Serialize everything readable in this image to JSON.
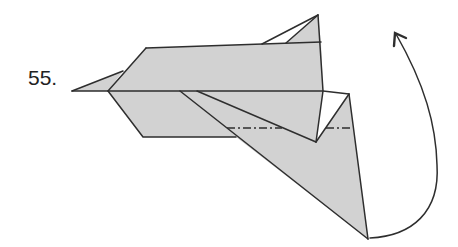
{
  "step": {
    "number": "55."
  },
  "diagram": {
    "colors": {
      "paper_fill": "#d2d2d2",
      "line": "#2e2e2e",
      "background": "#ffffff",
      "text": "#222222"
    },
    "fills": [
      {
        "name": "nose-flap",
        "points": "72,91 123,71 108,91"
      },
      {
        "name": "top-fin-flap",
        "points": "286,43 318,15 321,43"
      },
      {
        "name": "upper-body",
        "points": "108,91 146,48 321,42 323,91"
      },
      {
        "name": "lower-body",
        "points": "108,91 143,137 236,137 368,239 349,94 316,142 323,91"
      }
    ],
    "lines": [
      {
        "name": "nose-upper-edge",
        "points": "72,91 123,71"
      },
      {
        "name": "body-upper-left-edge",
        "points": "108,91 146,48"
      },
      {
        "name": "body-top-edge",
        "points": "146,48 321,42"
      },
      {
        "name": "top-fin-outer-edge",
        "points": "262,44 318,15"
      },
      {
        "name": "top-fin-inner-edge",
        "points": "286,43 318,15"
      },
      {
        "name": "body-right-edge",
        "points": "318,15 323,91 316,142"
      },
      {
        "name": "center-horizontal-edge",
        "points": "72,91 323,91 349,94"
      },
      {
        "name": "lower-body-left-edge",
        "points": "108,91 143,137 236,137"
      },
      {
        "name": "lower-flap-left-edge",
        "points": "180,91 368,239"
      },
      {
        "name": "lower-flap-inner-edge",
        "points": "197,91 316,142"
      },
      {
        "name": "lower-flap-right-edge",
        "points": "349,94 368,239"
      },
      {
        "name": "gap-diagonal-edge",
        "points": "349,94 316,142"
      }
    ],
    "fold_lines": [
      {
        "name": "valley-fold-line-left",
        "points": "227,128 282,128"
      },
      {
        "name": "valley-fold-line-right",
        "points": "326,128 353,128"
      }
    ],
    "arrow": {
      "name": "fold-up-arrow",
      "path": "M370,238 C412,236 440,212 437,165 C436,125 425,85 396,34",
      "head": "394,46 395,33 406,38"
    }
  }
}
